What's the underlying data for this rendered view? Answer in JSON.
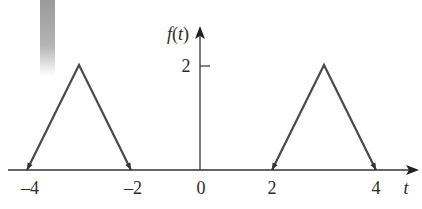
{
  "chart_data": {
    "type": "line",
    "title": "",
    "xlabel": "t",
    "ylabel": "f(t)",
    "x_ticks": [
      {
        "value": -4,
        "label": "–4"
      },
      {
        "value": -2,
        "label": "–2"
      },
      {
        "value": 0,
        "label": "0"
      },
      {
        "value": 2,
        "label": "2"
      },
      {
        "value": 4,
        "label": "4"
      }
    ],
    "y_ticks": [
      {
        "value": 2,
        "label": "2"
      }
    ],
    "series": [
      {
        "name": "pulse-left",
        "x": [
          -4,
          -3,
          -2
        ],
        "y": [
          0,
          2,
          0
        ]
      },
      {
        "name": "pulse-right",
        "x": [
          2,
          3,
          4
        ],
        "y": [
          0,
          2,
          0
        ]
      }
    ],
    "annotations": [
      "arrowheads at pulse endpoints"
    ],
    "xlim": [
      -4.5,
      5.3
    ],
    "ylim": [
      0,
      2.6
    ],
    "grid": false,
    "legend": "none"
  },
  "colors": {
    "curve": "#4a4a4a",
    "axis": "#333333",
    "text": "#2b2b2b"
  }
}
